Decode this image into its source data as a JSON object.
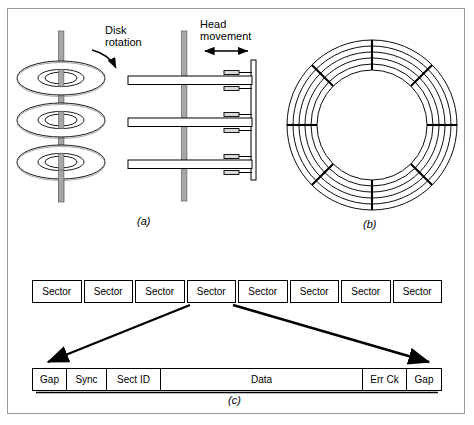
{
  "figure": {
    "title_present": false,
    "panels": [
      {
        "id": "a",
        "caption": "(a)",
        "name": "disk-platters-and-heads"
      },
      {
        "id": "b",
        "caption": "(b)",
        "name": "tracks-and-sectors-circle"
      },
      {
        "id": "c",
        "caption": "(c)",
        "name": "sector-format-breakdown"
      }
    ]
  },
  "annotations": {
    "disk_rotation": "Disk\nrotation",
    "disk_rotation_line1": "Disk",
    "disk_rotation_line2": "rotation",
    "head_movement_line1": "Head",
    "head_movement_line2": "movement"
  },
  "panel_a": {
    "platter_count": 3,
    "head_arm_count": 3,
    "heads_per_arm": 2,
    "spindle_color": "#a6a6a6",
    "arm_color": "#ffffff",
    "outline_color": "#000000"
  },
  "panel_b": {
    "track_count": 6,
    "sector_divider_count": 8,
    "outline_color": "#000000"
  },
  "panel_c": {
    "sector_strip": {
      "cells": [
        "Sector",
        "Sector",
        "Sector",
        "Sector",
        "Sector",
        "Sector",
        "Sector",
        "Sector"
      ]
    },
    "detail_strip": {
      "fields": [
        {
          "label": "Gap",
          "key": "gap-left"
        },
        {
          "label": "Sync",
          "key": "sync"
        },
        {
          "label": "Sect ID",
          "key": "sect-id"
        },
        {
          "label": "Data",
          "key": "data"
        },
        {
          "label": "Err Ck",
          "key": "err-ck"
        },
        {
          "label": "Gap",
          "key": "gap-right"
        }
      ]
    }
  },
  "colors": {
    "frame_border": "#9a9a9a",
    "ink": "#000000",
    "background": "#ffffff",
    "spindle_fill": "#a6a6a6"
  }
}
